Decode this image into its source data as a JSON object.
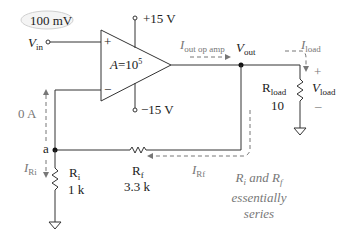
{
  "diagram": {
    "type": "non-inverting op-amp circuit",
    "input": {
      "value_badge": "100 mV",
      "symbol": "V",
      "subscript": "in"
    },
    "opamp": {
      "gain_symbol": "A",
      "gain_eq": "=10",
      "gain_exp": "5",
      "plus_label": "+",
      "minus_label": "−"
    },
    "supply": {
      "positive": "+15 V",
      "negative": "−15 V"
    },
    "output": {
      "symbol": "V",
      "subscript": "out"
    },
    "currents": {
      "opamp_out": {
        "symbol": "I",
        "subscript": "out op amp"
      },
      "load": {
        "symbol": "I",
        "subscript": "load"
      },
      "ri": {
        "symbol": "I",
        "subscript": "Ri"
      },
      "rf": {
        "symbol": "I",
        "subscript": "Rf"
      },
      "inverting_input": "0 A"
    },
    "load": {
      "name": "R",
      "name_sub": "load",
      "value": "10",
      "v_symbol": "V",
      "v_sub": "load",
      "plus": "+",
      "minus": "–"
    },
    "node_a": "a",
    "ri": {
      "name": "R",
      "name_sub": "i",
      "value": "1 k"
    },
    "rf": {
      "name": "R",
      "name_sub": "f",
      "value": "3.3 k"
    },
    "note": {
      "line1_r1": "R",
      "line1_r1_sub": "i",
      "line1_mid": " and ",
      "line1_r2": "R",
      "line1_r2_sub": "f",
      "line2": "essentially",
      "line3": "series"
    },
    "colors": {
      "wire": "#333333",
      "annotation": "#777777",
      "badge_border": "#cfcfcf"
    }
  }
}
